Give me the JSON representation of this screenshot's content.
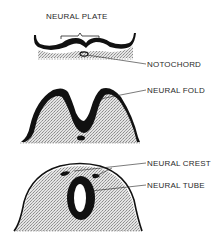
{
  "diagram": {
    "type": "biology-stages",
    "colors": {
      "ink": "#111111",
      "stipple": "#c9c9c9",
      "background": "#ffffff",
      "text": "#2a2a2a"
    },
    "stages": [
      {
        "id": "stage-1",
        "title": "NEURAL PLATE",
        "labels": [
          {
            "text": "NOTOCHORD"
          }
        ]
      },
      {
        "id": "stage-2",
        "labels": [
          {
            "text": "NEURAL FOLD"
          }
        ]
      },
      {
        "id": "stage-3",
        "labels": [
          {
            "text": "NEURAL CREST"
          },
          {
            "text": "NEURAL TUBE"
          }
        ]
      }
    ]
  }
}
